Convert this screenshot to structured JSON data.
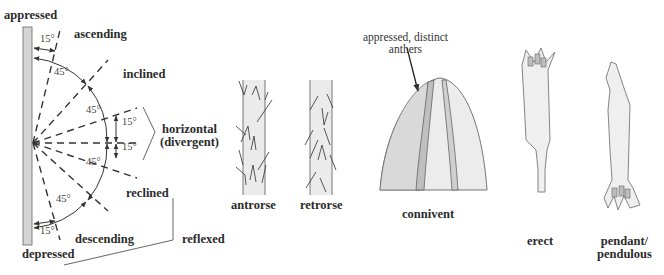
{
  "diagram": {
    "angle_diagram": {
      "labels": {
        "appressed": "appressed",
        "ascending": "ascending",
        "inclined": "inclined",
        "horizontal": "horizontal",
        "divergent": "(divergent)",
        "reclined": "reclined",
        "descending": "descending",
        "depressed": "depressed",
        "reflexed": "reflexed"
      },
      "angles": {
        "top_15": "15°",
        "upper_45a": "45°",
        "upper_45b": "45°",
        "horiz_15_up": "15°",
        "horiz_15_down": "15°",
        "lower_45a": "45°",
        "lower_45b": "45°",
        "bottom_15": "15°"
      }
    },
    "hairs": [
      {
        "label": "antrorse"
      },
      {
        "label": "retrorse"
      }
    ],
    "anthers": {
      "label": "connivent",
      "annotation_line1": "appressed, distinct",
      "annotation_line2": "anthers"
    },
    "flowers": [
      {
        "label": "erect"
      },
      {
        "label_line1": "pendant/",
        "label_line2": "pendulous"
      }
    ],
    "colors": {
      "stroke": "#3a3a3a",
      "fill_light": "#ececec",
      "fill_mid": "#d6d6d6",
      "stem": "#cfcfcf"
    }
  }
}
